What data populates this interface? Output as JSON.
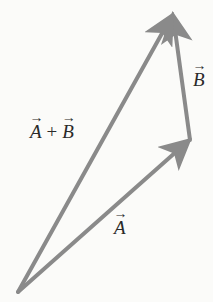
{
  "diagram": {
    "colors": {
      "background": "#fbfbf9",
      "vector": "#8a8a8a",
      "label": "#2a2a2a"
    },
    "points": {
      "origin": [
        18,
        292
      ],
      "a_tip": [
        190,
        140
      ],
      "b_tip": [
        173,
        14
      ]
    },
    "vectors": [
      {
        "id": "A",
        "from": "origin",
        "to": "a_tip"
      },
      {
        "id": "B",
        "from": "a_tip",
        "to": "b_tip"
      },
      {
        "id": "A_plus_B",
        "from": "origin",
        "to": "b_tip"
      }
    ],
    "labels": {
      "sum": {
        "left": "A",
        "operator": "+",
        "right": "B",
        "arrow": "→"
      },
      "b": {
        "symbol": "B",
        "arrow": "→"
      },
      "a": {
        "symbol": "A",
        "arrow": "→"
      }
    }
  }
}
